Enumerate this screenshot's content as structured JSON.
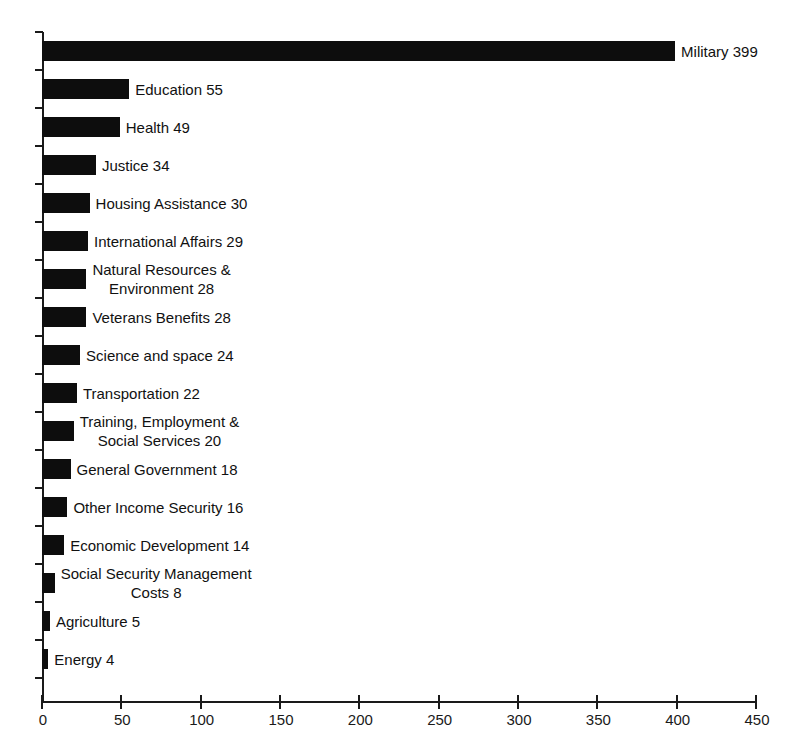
{
  "chart_data": {
    "type": "bar",
    "orientation": "horizontal",
    "title": "",
    "subtitle": "",
    "xlabel": "",
    "ylabel": "",
    "xlim": [
      0,
      450
    ],
    "ylim": null,
    "grid": false,
    "legend": null,
    "bar_color": "#0d0d0d",
    "background_color": "#ffffff",
    "axis_color": "#1a1a1a",
    "x_ticks": [
      0,
      50,
      100,
      150,
      200,
      250,
      300,
      350,
      400,
      450
    ],
    "x_tick_labels": [
      "0",
      "50",
      "100",
      "150",
      "200",
      "250",
      "300",
      "350",
      "400",
      "450"
    ],
    "label_format": "{category} {value}",
    "categories": [
      "Military",
      "Education",
      "Health",
      "Justice",
      "Housing Assistance",
      "International Affairs",
      "Natural Resources & Environment",
      "Veterans Benefits",
      "Science and space",
      "Transportation",
      "Training, Employment & Social Services",
      "General Government",
      "Other Income Security",
      "Economic Development",
      "Social Security Management Costs",
      "Agriculture",
      "Energy"
    ],
    "values": [
      399,
      55,
      49,
      34,
      30,
      29,
      28,
      28,
      24,
      22,
      20,
      18,
      16,
      14,
      8,
      5,
      4
    ],
    "bars": [
      {
        "category": "Military",
        "value": 399,
        "label_lines": [
          "Military 399"
        ]
      },
      {
        "category": "Education",
        "value": 55,
        "label_lines": [
          "Education 55"
        ]
      },
      {
        "category": "Health",
        "value": 49,
        "label_lines": [
          "Health 49"
        ]
      },
      {
        "category": "Justice",
        "value": 34,
        "label_lines": [
          "Justice 34"
        ]
      },
      {
        "category": "Housing Assistance",
        "value": 30,
        "label_lines": [
          "Housing Assistance 30"
        ]
      },
      {
        "category": "International Affairs",
        "value": 29,
        "label_lines": [
          "International Affairs 29"
        ]
      },
      {
        "category": "Natural Resources & Environment",
        "value": 28,
        "label_lines": [
          "Natural Resources &",
          "Environment 28"
        ]
      },
      {
        "category": "Veterans Benefits",
        "value": 28,
        "label_lines": [
          "Veterans Benefits 28"
        ]
      },
      {
        "category": "Science and space",
        "value": 24,
        "label_lines": [
          "Science and space 24"
        ]
      },
      {
        "category": "Transportation",
        "value": 22,
        "label_lines": [
          "Transportation 22"
        ]
      },
      {
        "category": "Training, Employment & Social Services",
        "value": 20,
        "label_lines": [
          "Training, Employment &",
          "Social Services 20"
        ]
      },
      {
        "category": "General Government",
        "value": 18,
        "label_lines": [
          "General Government 18"
        ]
      },
      {
        "category": "Other Income Security",
        "value": 16,
        "label_lines": [
          "Other Income Security 16"
        ]
      },
      {
        "category": "Economic Development",
        "value": 14,
        "label_lines": [
          "Economic Development 14"
        ]
      },
      {
        "category": "Social Security Management Costs",
        "value": 8,
        "label_lines": [
          "Social Security Management",
          "Costs 8"
        ]
      },
      {
        "category": "Agriculture",
        "value": 5,
        "label_lines": [
          "Agriculture 5"
        ]
      },
      {
        "category": "Energy",
        "value": 4,
        "label_lines": [
          "Energy 4"
        ]
      }
    ]
  },
  "geometry": {
    "origin_x": 42,
    "origin_y": 702,
    "plot_top": 32,
    "px_per_unit": 1.5867,
    "row_pitch": 38,
    "bar_height": 20,
    "label_gap": 6
  }
}
